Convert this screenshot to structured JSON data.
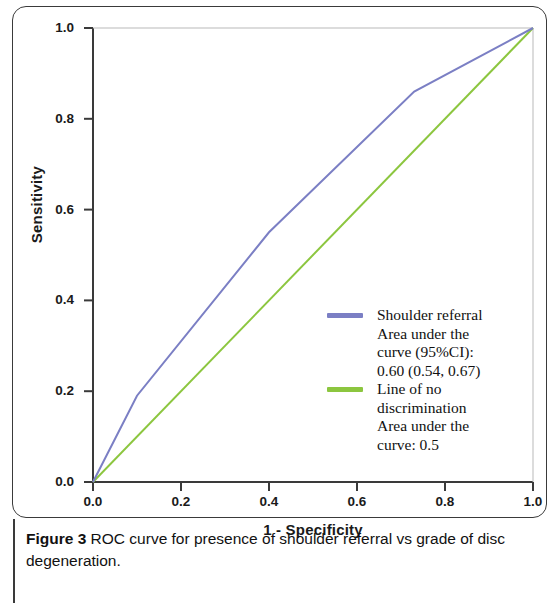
{
  "figure": {
    "caption_label": "Figure 3",
    "caption_text": "ROC curve for presence of shoulder referral vs grade of disc degeneration."
  },
  "axes": {
    "x_title": "1 - Specificity",
    "y_title": "Sensitivity",
    "x_ticks": [
      "0.0",
      "0.2",
      "0.4",
      "0.6",
      "0.8",
      "1.0"
    ],
    "y_ticks": [
      "0.0",
      "0.2",
      "0.4",
      "0.6",
      "0.8",
      "1.0"
    ]
  },
  "legend": {
    "entries": [
      {
        "swatch_color": "#7b7fc4",
        "lines": [
          "Shoulder referral",
          "Area under the",
          "curve (95%CI):",
          "0.60 (0.54, 0.67)"
        ]
      },
      {
        "swatch_color": "#8cc63f",
        "lines": [
          "Line of no",
          "discrimination",
          "Area under the",
          "curve: 0.5"
        ]
      }
    ]
  },
  "chart_data": {
    "type": "line",
    "title": "ROC curve for presence of shoulder referral vs grade of disc degeneration",
    "xlabel": "1 - Specificity",
    "ylabel": "Sensitivity",
    "xlim": [
      0,
      1
    ],
    "ylim": [
      0,
      1
    ],
    "xticks": [
      0.0,
      0.2,
      0.4,
      0.6,
      0.8,
      1.0
    ],
    "yticks": [
      0.0,
      0.2,
      0.4,
      0.6,
      0.8,
      1.0
    ],
    "grid": false,
    "legend_position": "inside-lower-right",
    "series": [
      {
        "name": "Shoulder referral",
        "color": "#7b7fc4",
        "auc": 0.6,
        "auc_ci": [
          0.54,
          0.67
        ],
        "auc_label": "0.60 (0.54, 0.67)",
        "x": [
          0.0,
          0.1,
          0.4,
          0.73,
          1.0
        ],
        "y": [
          0.0,
          0.19,
          0.55,
          0.86,
          1.0
        ]
      },
      {
        "name": "Line of no discrimination",
        "color": "#8cc63f",
        "auc": 0.5,
        "auc_label": "0.5",
        "x": [
          0.0,
          1.0
        ],
        "y": [
          0.0,
          1.0
        ]
      }
    ]
  }
}
